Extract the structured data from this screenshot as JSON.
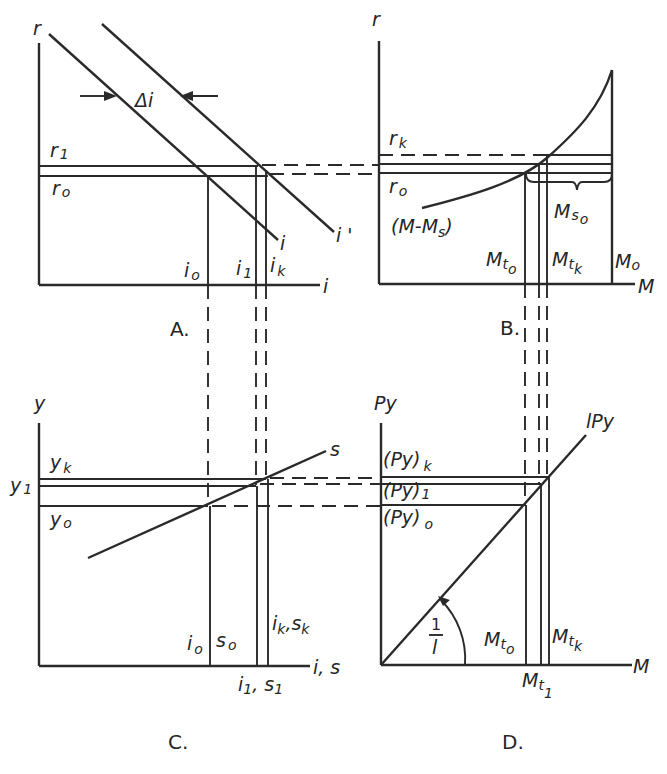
{
  "panels": {
    "A": {
      "caption": "A.",
      "y_axis": "r",
      "x_axis": "i",
      "curves": [
        {
          "name": "i",
          "label": "i"
        },
        {
          "name": "i_prime",
          "label": "i '"
        }
      ],
      "shift_label": "Δi",
      "levels": {
        "r1": {
          "base": "r",
          "sub": "1"
        },
        "r0": {
          "base": "r",
          "sub": "o"
        }
      },
      "x_marks": {
        "i0": {
          "base": "i",
          "sub": "o"
        },
        "i1": {
          "base": "i",
          "sub": "1"
        },
        "ik": {
          "base": "i",
          "sub": "k"
        }
      }
    },
    "B": {
      "caption": "B.",
      "y_axis": "r",
      "x_axis": "M",
      "curve_label": "(M-M",
      "curve_label_sub": "s",
      "curve_label_end": ")",
      "levels": {
        "rk": {
          "base": "r",
          "sub": "k"
        },
        "r0": {
          "base": "r",
          "sub": "o"
        }
      },
      "x_marks": {
        "Mt0": {
          "base": "M",
          "sub": "t",
          "subsub": "o"
        },
        "Mtk": {
          "base": "M",
          "sub": "t",
          "subsub": "k"
        },
        "M0": {
          "base": "M",
          "sub": "o"
        }
      },
      "brace_label": {
        "base": "M",
        "sub": "s",
        "subsub": "o"
      }
    },
    "C": {
      "caption": "C.",
      "y_axis": "y",
      "x_axis": "i, s",
      "curve_label": "s",
      "levels": {
        "yk": {
          "base": "y",
          "sub": "k"
        },
        "y1": {
          "base": "y",
          "sub": "1"
        },
        "y0": {
          "base": "y",
          "sub": "o"
        }
      },
      "x_marks": {
        "i0s0": "i o s o",
        "iksk": "i k , s k",
        "i1s1": "i 1 , s 1"
      }
    },
    "D": {
      "caption": "D.",
      "y_axis": "Py",
      "x_axis": "M",
      "curve_label": "lPy",
      "slope_label_num": "1",
      "slope_label_den": "l",
      "levels": {
        "Pyk": "(Py)",
        "Pyk_sub": "k",
        "Py1": "(Py)",
        "Py1_sub": "1",
        "Py0": "(Py)",
        "Py0_sub": "o"
      },
      "x_marks": {
        "Mt0": {
          "base": "M",
          "sub": "t",
          "subsub": "o"
        },
        "Mtk": {
          "base": "M",
          "sub": "t",
          "subsub": "k"
        },
        "Mt1": {
          "base": "M",
          "sub": "t",
          "subsub": "1"
        }
      }
    }
  }
}
